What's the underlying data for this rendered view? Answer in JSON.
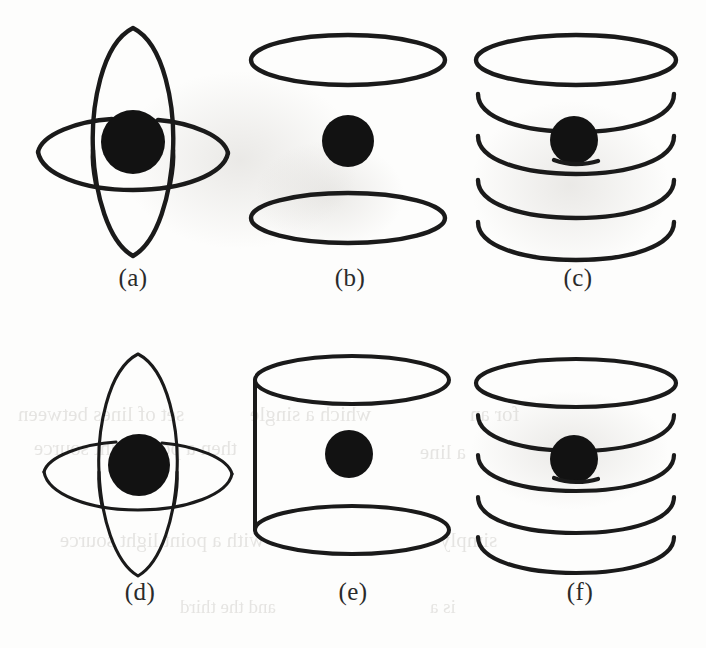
{
  "figure": {
    "background_color": "#fdfdfc",
    "ink_color": "#1a1a1a",
    "nucleus_color": "#121212",
    "page_width": 706,
    "page_height": 648,
    "bleed_color": "#cfcdc9"
  },
  "panels": [
    {
      "id": "a",
      "caption": "(a)",
      "kind": "crossed-orbits",
      "description": "Two perpendicular ellipses interlocking around a filled nucleus",
      "orbit_count": 2,
      "nucleus_radius": 32,
      "stroke_width": 4.4
    },
    {
      "id": "b",
      "caption": "(b)",
      "kind": "two-parallel-rings",
      "description": "Two separate horizontal ellipses above and below a filled nucleus",
      "orbit_count": 2,
      "nucleus_radius": 26,
      "stroke_width": 4.4
    },
    {
      "id": "c",
      "caption": "(c)",
      "kind": "helix-coil",
      "description": "Closed top ring over four open coil turns with nucleus on the middle turn",
      "orbit_count": 5,
      "nucleus_radius": 24,
      "stroke_width": 4.4
    },
    {
      "id": "d",
      "caption": "(d)",
      "kind": "crossed-orbits",
      "description": "Two perpendicular ellipses interlocking around a filled nucleus, thinner stroke",
      "orbit_count": 2,
      "nucleus_radius": 31,
      "stroke_width": 3.1
    },
    {
      "id": "e",
      "caption": "(e)",
      "kind": "cylinder",
      "description": "Two horizontal ellipses joined by a vertical line on the left forming a cylinder",
      "orbit_count": 2,
      "nucleus_radius": 24,
      "stroke_width": 4.0
    },
    {
      "id": "f",
      "caption": "(f)",
      "kind": "helix-coil",
      "description": "Closed top ring over four open coil turns with nucleus on the middle turn",
      "orbit_count": 5,
      "nucleus_radius": 24,
      "stroke_width": 4.2
    }
  ],
  "bleed_through": [
    {
      "text": "set of lines between",
      "x": 18,
      "y": 414,
      "size": 21
    },
    {
      "text": "which a single",
      "x": 250,
      "y": 414,
      "size": 21
    },
    {
      "text": "for an",
      "x": 470,
      "y": 414,
      "size": 21
    },
    {
      "text": "then a point light source",
      "x": 34,
      "y": 448,
      "size": 21
    },
    {
      "text": "a line",
      "x": 420,
      "y": 452,
      "size": 21
    },
    {
      "text": "with a point light source",
      "x": 60,
      "y": 540,
      "size": 21
    },
    {
      "text": "simply",
      "x": 440,
      "y": 540,
      "size": 21
    },
    {
      "text": "and the third",
      "x": 180,
      "y": 606,
      "size": 19
    },
    {
      "text": "is a",
      "x": 430,
      "y": 606,
      "size": 19
    }
  ]
}
